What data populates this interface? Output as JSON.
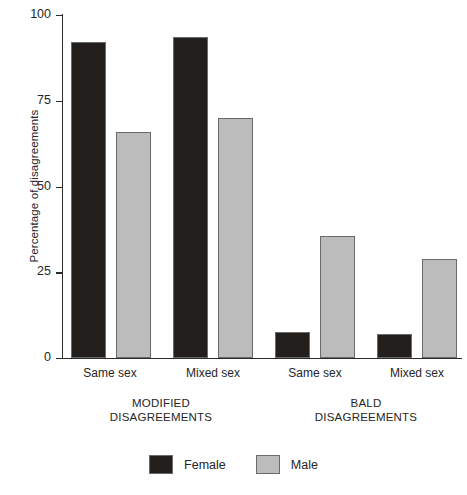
{
  "chart_data": {
    "type": "bar",
    "title": "",
    "xlabel": "",
    "ylabel": "Percentage of disagreements",
    "ylim": [
      0,
      100
    ],
    "yticks": [
      0,
      25,
      50,
      75,
      100
    ],
    "ytick_labels": [
      "0",
      "25",
      "50",
      "75",
      "100"
    ],
    "grid": false,
    "legend_position": "bottom-center",
    "categories": [
      "Same sex",
      "Mixed sex",
      "Same sex",
      "Mixed sex"
    ],
    "groups": [
      {
        "label_line1": "MODIFIED",
        "label_line2": "DISAGREEMENTS",
        "categories": [
          "Same sex",
          "Mixed sex"
        ]
      },
      {
        "label_line1": "BALD",
        "label_line2": "DISAGREEMENTS",
        "categories": [
          "Same sex",
          "Mixed sex"
        ]
      }
    ],
    "series": [
      {
        "name": "Female",
        "color": "#231f1c",
        "values": [
          92,
          93.5,
          7.5,
          7
        ]
      },
      {
        "name": "Male",
        "color": "#bcbcbc",
        "values": [
          66,
          70,
          35.5,
          29
        ]
      }
    ],
    "bars": [
      {
        "group": "MODIFIED DISAGREEMENTS",
        "category": "Same sex",
        "series": "Female",
        "value": 92
      },
      {
        "group": "MODIFIED DISAGREEMENTS",
        "category": "Same sex",
        "series": "Male",
        "value": 66
      },
      {
        "group": "MODIFIED DISAGREEMENTS",
        "category": "Mixed sex",
        "series": "Female",
        "value": 93.5
      },
      {
        "group": "MODIFIED DISAGREEMENTS",
        "category": "Mixed sex",
        "series": "Male",
        "value": 70
      },
      {
        "group": "BALD DISAGREEMENTS",
        "category": "Same sex",
        "series": "Female",
        "value": 7.5
      },
      {
        "group": "BALD DISAGREEMENTS",
        "category": "Same sex",
        "series": "Male",
        "value": 35.5
      },
      {
        "group": "BALD DISAGREEMENTS",
        "category": "Mixed sex",
        "series": "Female",
        "value": 7
      },
      {
        "group": "BALD DISAGREEMENTS",
        "category": "Mixed sex",
        "series": "Male",
        "value": 29
      }
    ]
  },
  "legend": {
    "items": [
      {
        "label": "Female",
        "color": "#231f1c"
      },
      {
        "label": "Male",
        "color": "#bcbcbc"
      }
    ]
  }
}
